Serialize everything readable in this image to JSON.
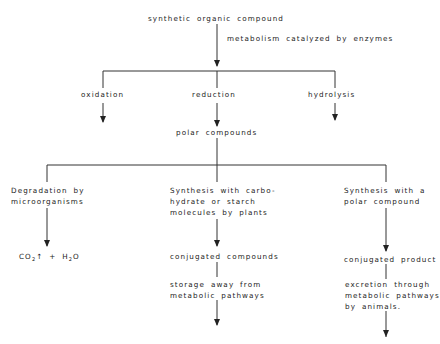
{
  "diagram": {
    "root": "synthetic organic compound",
    "edge_label": "metabolism catalyzed by enzymes",
    "level1": [
      "oxidation",
      "reduction",
      "hydrolysis"
    ],
    "merge": "polar compounds",
    "branches": [
      {
        "title_lines": [
          "Degradation by",
          "microorganisms"
        ],
        "product_parts": {
          "co": "CO",
          "sub2": "2",
          "rest": "↑ + H",
          "sub2b": "2",
          "o": "O"
        }
      },
      {
        "title_lines": [
          "Synthesis with carbo-",
          "hydrate or starch",
          "molecules by plants"
        ],
        "product": "conjugated compounds",
        "fate_lines": [
          "storage away from",
          "metabolic pathways"
        ]
      },
      {
        "title_lines": [
          "Synthesis with a",
          "polar compound"
        ],
        "product": "conjugated product",
        "fate_lines": [
          "excretion through",
          "metabolic pathways",
          "by animals."
        ]
      }
    ]
  }
}
